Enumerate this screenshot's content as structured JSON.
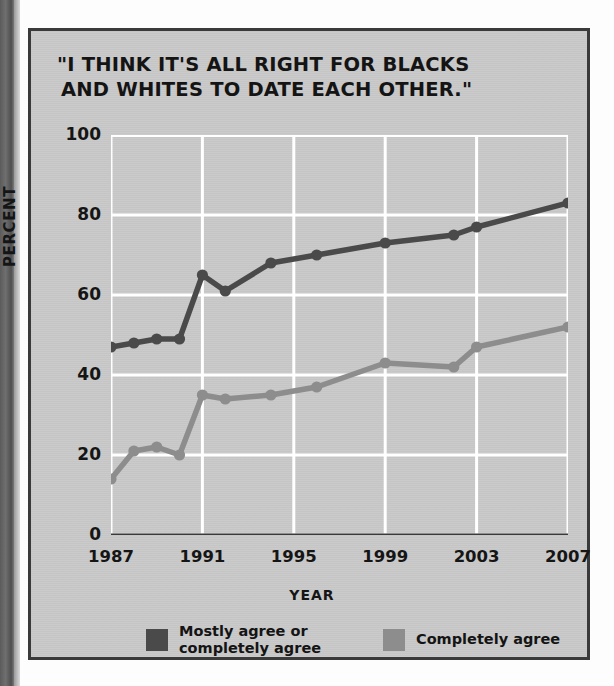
{
  "panel": {
    "title_line1": "\"I THINK IT'S ALL RIGHT FOR BLACKS",
    "title_line2": "AND WHITES TO DATE EACH OTHER.\"",
    "background_color": "#c9c9c9",
    "border_color": "#3a3a3a"
  },
  "chart_data": {
    "type": "line",
    "title": "\"I THINK IT'S ALL RIGHT FOR BLACKS AND WHITES TO DATE EACH OTHER.\"",
    "xlabel": "YEAR",
    "ylabel": "PERCENT",
    "xlim": [
      1987,
      2007
    ],
    "ylim": [
      0,
      100
    ],
    "yticks": [
      0,
      20,
      40,
      60,
      80,
      100
    ],
    "ytick_labels": [
      "0",
      "20",
      "40",
      "60",
      "80",
      "100"
    ],
    "xticks": [
      1987,
      1991,
      1995,
      1999,
      2003,
      2007
    ],
    "xtick_labels": [
      "1987",
      "1991",
      "1995",
      "1999",
      "2003",
      "2007"
    ],
    "grid": true,
    "grid_color": "#ffffff",
    "legend_position": "bottom",
    "series": [
      {
        "name": "Mostly agree or completely agree",
        "color": "#4a4a4a",
        "x": [
          1987,
          1988,
          1989,
          1990,
          1991,
          1992,
          1994,
          1996,
          1999,
          2002,
          2003,
          2007
        ],
        "values": [
          47,
          48,
          49,
          49,
          65,
          61,
          68,
          70,
          73,
          75,
          77,
          83
        ]
      },
      {
        "name": "Completely agree",
        "color": "#8d8d8d",
        "x": [
          1987,
          1988,
          1989,
          1990,
          1991,
          1992,
          1994,
          1996,
          1999,
          2002,
          2003,
          2007
        ],
        "values": [
          14,
          21,
          22,
          20,
          35,
          34,
          35,
          37,
          43,
          42,
          47,
          52
        ]
      }
    ]
  },
  "legend": {
    "items": [
      {
        "label_line1": "Mostly agree or",
        "label_line2": "completely agree",
        "color": "#4a4a4a"
      },
      {
        "label_line1": "Completely agree",
        "label_line2": "",
        "color": "#8d8d8d"
      }
    ]
  }
}
